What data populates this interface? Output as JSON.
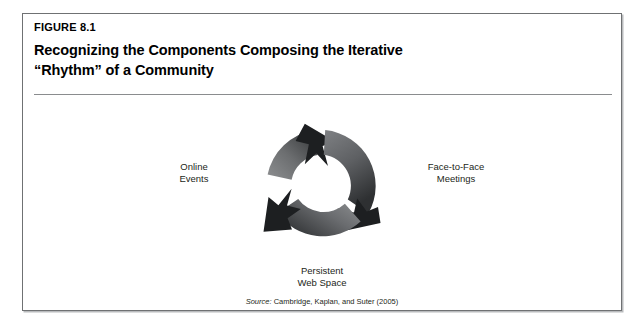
{
  "figure": {
    "kicker": "FIGURE 8.1",
    "title": "Recognizing the Components Composing the Iterative\n“Rhythm” of a Community",
    "source_label": "Source:",
    "source_text": " Cambridge, Kaplan, and Suter (2005)"
  },
  "diagram": {
    "type": "cyclical-process",
    "shape": "three-segment-ring-with-clockwise-arrows",
    "segment_count": 3,
    "direction": "clockwise",
    "labels": {
      "online_events": "Online\nEvents",
      "face_to_face": "Face-to-Face\nMeetings",
      "persistent_web_space": "Persistent\nWeb Space"
    },
    "segments": [
      {
        "name": "online-events",
        "label": "Online\nEvents",
        "position": "upper-left",
        "arrowhead_at": "top"
      },
      {
        "name": "face-to-face-meetings",
        "label": "Face-to-Face\nMeetings",
        "position": "right",
        "arrowhead_at": "lower-right"
      },
      {
        "name": "persistent-web-space",
        "label": "Persistent\nWeb Space",
        "position": "lower-left",
        "arrowhead_at": "lower-left"
      }
    ]
  },
  "colors": {
    "frame_border": "#6f7173",
    "frame_shadow": "#b9bbbd",
    "title_rule": "#8a8c8e",
    "text": "#231f20",
    "ring_light": "#8e9092",
    "ring_mid": "#6a6c6e",
    "ring_dark": "#3a3c3e",
    "arrowhead": "#231f20",
    "page_background": "#ffffff"
  }
}
